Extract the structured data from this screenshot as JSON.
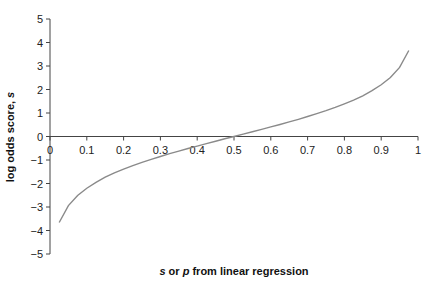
{
  "chart_data": {
    "type": "line",
    "title": "",
    "xlabel": "s or p from linear regression",
    "xlabel_parts": [
      {
        "text": "s",
        "italic": true
      },
      {
        "text": " or ",
        "italic": false
      },
      {
        "text": "p",
        "italic": true
      },
      {
        "text": " from linear regression",
        "italic": false
      }
    ],
    "ylabel": "log odds score, s",
    "ylabel_parts": [
      {
        "text": "log odds score, ",
        "italic": false
      },
      {
        "text": "s",
        "italic": true
      }
    ],
    "xlim": [
      0,
      1
    ],
    "ylim": [
      -5,
      5
    ],
    "x_ticks": [
      "0",
      "0.1",
      "0.2",
      "0.3",
      "0.4",
      "0.5",
      "0.6",
      "0.7",
      "0.8",
      "0.9",
      "1"
    ],
    "y_ticks": [
      "5",
      "4",
      "3",
      "2",
      "1",
      "0",
      "-1",
      "-2",
      "-3",
      "-4",
      "-5"
    ],
    "grid": false,
    "legend": null,
    "series": [
      {
        "name": "log odds (logit) of p",
        "color": "#8a8a8a",
        "x": [
          0.025,
          0.05,
          0.075,
          0.1,
          0.125,
          0.15,
          0.175,
          0.2,
          0.225,
          0.25,
          0.275,
          0.3,
          0.325,
          0.35,
          0.375,
          0.4,
          0.425,
          0.45,
          0.475,
          0.5,
          0.525,
          0.55,
          0.575,
          0.6,
          0.625,
          0.65,
          0.675,
          0.7,
          0.725,
          0.75,
          0.775,
          0.8,
          0.825,
          0.85,
          0.875,
          0.9,
          0.925,
          0.95,
          0.975
        ],
        "y": [
          -3.66,
          -2.94,
          -2.51,
          -2.2,
          -1.95,
          -1.73,
          -1.55,
          -1.39,
          -1.24,
          -1.1,
          -0.97,
          -0.85,
          -0.73,
          -0.62,
          -0.51,
          -0.41,
          -0.3,
          -0.2,
          -0.1,
          0.0,
          0.1,
          0.2,
          0.3,
          0.41,
          0.51,
          0.62,
          0.73,
          0.85,
          0.97,
          1.1,
          1.24,
          1.39,
          1.55,
          1.73,
          1.95,
          2.2,
          2.51,
          2.94,
          3.66
        ]
      }
    ]
  },
  "colors": {
    "axis": "#444444",
    "curve": "#8a8a8a",
    "text": "#222222"
  }
}
